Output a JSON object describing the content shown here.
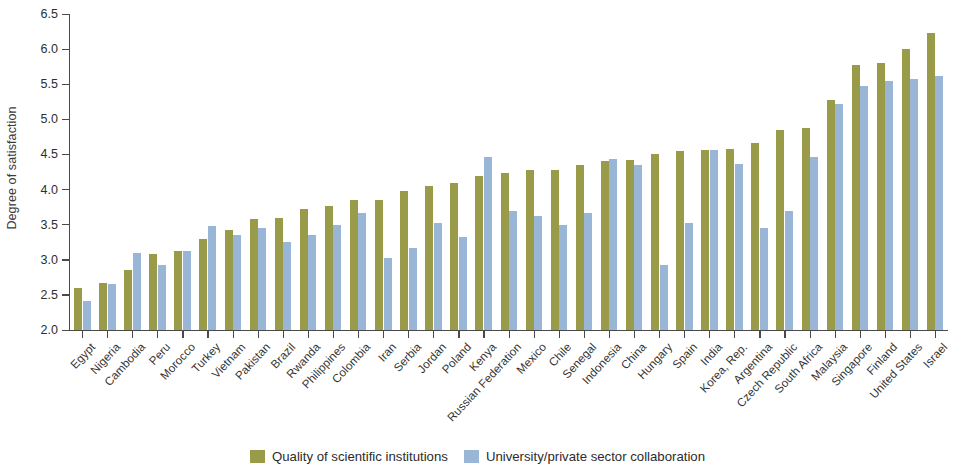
{
  "chart_data": {
    "type": "bar",
    "title": "",
    "xlabel": "",
    "ylabel": "Degree of satisfaction",
    "ylim": [
      2.0,
      6.5
    ],
    "ytick_step": 0.5,
    "yticks": [
      "2.0",
      "2.5",
      "3.0",
      "3.5",
      "4.0",
      "4.5",
      "5.0",
      "5.5",
      "6.0",
      "6.5"
    ],
    "grid": false,
    "legend_position": "bottom-center",
    "colors": {
      "quality_of_scientific_institutions": "#9a9b49",
      "university_private_sector_collaboration": "#9ab6d6",
      "axis": "#4a4a4a",
      "text": "#2e2e2e",
      "background": "#ffffff"
    },
    "categories": [
      "Egypt",
      "Nigeria",
      "Cambodia",
      "Peru",
      "Morocco",
      "Turkey",
      "Vietnam",
      "Pakistan",
      "Brazil",
      "Rwanda",
      "Philippines",
      "Colombia",
      "Iran",
      "Serbia",
      "Jordan",
      "Poland",
      "Kenya",
      "Russian Federation",
      "Mexico",
      "Chile",
      "Senegal",
      "Indonesia",
      "China",
      "Hungary",
      "Spain",
      "India",
      "Korea, Rep.",
      "Argentina",
      "Czech Republic",
      "South Africa",
      "Malaysia",
      "Singapore",
      "Finland",
      "United States",
      "Israel"
    ],
    "series": [
      {
        "name": "Quality of scientific institutions",
        "color": "#9a9b49",
        "values": [
          2.6,
          2.67,
          2.85,
          3.08,
          3.12,
          3.3,
          3.42,
          3.58,
          3.6,
          3.72,
          3.77,
          3.85,
          3.85,
          3.98,
          4.05,
          4.1,
          4.2,
          4.24,
          4.28,
          4.28,
          4.35,
          4.4,
          4.42,
          4.5,
          4.55,
          4.57,
          4.58,
          4.67,
          4.85,
          4.87,
          5.27,
          5.78,
          5.8,
          6.0,
          6.23
        ]
      },
      {
        "name": "University/private sector collaboration",
        "color": "#9ab6d6",
        "values": [
          2.42,
          2.66,
          3.1,
          2.93,
          3.12,
          3.48,
          3.35,
          3.45,
          3.25,
          3.35,
          3.49,
          3.67,
          3.03,
          3.17,
          3.53,
          3.32,
          4.47,
          3.7,
          3.63,
          3.5,
          3.66,
          4.44,
          4.35,
          2.93,
          3.53,
          4.57,
          4.37,
          3.45,
          3.7,
          4.47,
          5.22,
          5.48,
          5.55,
          5.57,
          5.62
        ]
      }
    ]
  },
  "legend": {
    "items": [
      {
        "label": "Quality of scientific institutions",
        "color": "#9a9b49"
      },
      {
        "label": "University/private sector collaboration",
        "color": "#9ab6d6"
      }
    ]
  }
}
